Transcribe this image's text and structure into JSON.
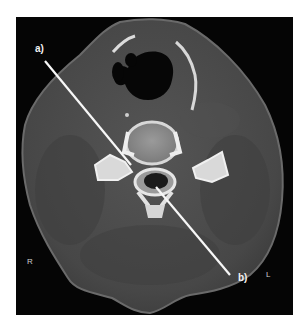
{
  "figure": {
    "type": "axial CT scan of neck (bone window)",
    "annotations": [
      {
        "id": "a",
        "label": "a)",
        "pointer": {
          "from": [
            45,
            61
          ],
          "to": [
            131,
            165
          ]
        }
      },
      {
        "id": "b",
        "label": "b)",
        "pointer": {
          "from": [
            230,
            275
          ],
          "to": [
            156,
            187
          ]
        }
      }
    ],
    "orientation": {
      "right": "R",
      "left": "L"
    },
    "colors": {
      "background": "#050505",
      "soft_tissue": "#4a4a4a",
      "bone": "#e8e8e8",
      "air": "#000000",
      "annotation": "#f5f5f5"
    }
  }
}
